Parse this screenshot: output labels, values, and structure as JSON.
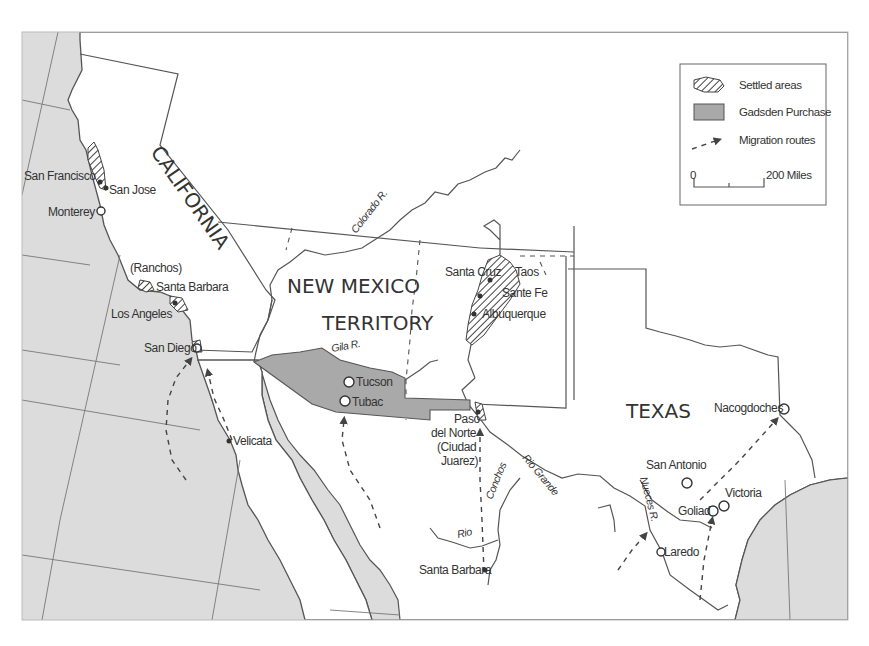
{
  "map": {
    "regions": [
      {
        "id": "california",
        "label": "CALIFORNIA"
      },
      {
        "id": "new-mexico-1",
        "label": "NEW MEXICO"
      },
      {
        "id": "new-mexico-2",
        "label": "TERRITORY"
      },
      {
        "id": "texas",
        "label": "TEXAS"
      }
    ],
    "places": {
      "san_francisco": "San Francisco",
      "san_jose": "San Jose",
      "monterey": "Monterey",
      "ranchos": "(Ranchos)",
      "santa_barbara_ca": "Santa Barbara",
      "los_angeles": "Los Angeles",
      "san_diego": "San Diego",
      "velicata": "Velicata",
      "tucson": "Tucson",
      "tubac": "Tubac",
      "santa_cruz": "Santa Cruz",
      "taos": "Taos",
      "santa_fe": "Sante Fe",
      "albuquerque": "Albuquerque",
      "paso_1": "Paso",
      "paso_2": "del Norte",
      "paso_3": "(Ciudad",
      "paso_4": "Juarez)",
      "santa_barbara_mx": "Santa Barbara",
      "nacogdoches": "Nacogdoches",
      "san_antonio": "San Antonio",
      "victoria": "Victoria",
      "goliad": "Goliad",
      "laredo": "Laredo"
    },
    "rivers": {
      "colorado": "Colorado R.",
      "gila": "Gila R.",
      "rio_grande": "Rio Grande",
      "conchos": "Conchos",
      "rio": "Rio",
      "nueces": "Nueces R."
    }
  },
  "legend": {
    "items": [
      {
        "label": "Settled areas",
        "symbol": "hatched-area"
      },
      {
        "label": "Gadsden Purchase",
        "symbol": "gray-box"
      },
      {
        "label": "Migration routes",
        "symbol": "dashed-arrow"
      }
    ],
    "scale": {
      "start": "0",
      "end": "200 Miles"
    }
  },
  "colors": {
    "sea": "#dcdcdc",
    "land": "#ffffff",
    "gadsden": "#a9a9a9",
    "ink": "#333333"
  }
}
